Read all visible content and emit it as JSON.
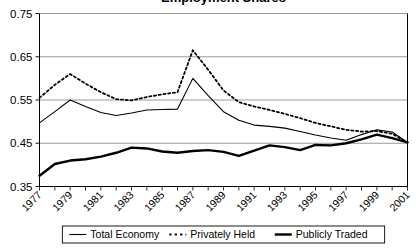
{
  "chart_data": {
    "type": "line",
    "title": "Employment Shares",
    "xlabel": "",
    "ylabel": "",
    "xlim": [
      1977,
      2001
    ],
    "ylim": [
      0.35,
      0.75
    ],
    "yticks": [
      0.35,
      0.45,
      0.55,
      0.65,
      0.75
    ],
    "ytick_labels": [
      "0.35",
      "0.45",
      "0.55",
      "0.65",
      "0.75"
    ],
    "x": [
      1977,
      1978,
      1979,
      1980,
      1981,
      1982,
      1983,
      1984,
      1985,
      1986,
      1987,
      1988,
      1989,
      1990,
      1991,
      1992,
      1993,
      1994,
      1995,
      1996,
      1997,
      1998,
      1999,
      2000,
      2001
    ],
    "xtick_labels": [
      "1977",
      "1979",
      "1981",
      "1983",
      "1985",
      "1987",
      "1989",
      "1991",
      "1993",
      "1995",
      "1997",
      "1999",
      "2001"
    ],
    "xtick_values": [
      1977,
      1979,
      1981,
      1983,
      1985,
      1987,
      1989,
      1991,
      1993,
      1995,
      1997,
      1999,
      2001
    ],
    "grid": true,
    "legend_position": "bottom",
    "series": [
      {
        "name": "Total Economy",
        "style": "solid-thin",
        "color": "#000000",
        "width": 1.1,
        "values": [
          0.497,
          0.523,
          0.55,
          0.535,
          0.521,
          0.514,
          0.52,
          0.527,
          0.528,
          0.529,
          0.6,
          0.56,
          0.523,
          0.503,
          0.492,
          0.489,
          0.485,
          0.477,
          0.469,
          0.462,
          0.457,
          0.47,
          0.481,
          0.476,
          0.452
        ]
      },
      {
        "name": "Privately Held",
        "style": "dotted",
        "color": "#000000",
        "width": 1.8,
        "values": [
          0.555,
          0.585,
          0.61,
          0.588,
          0.568,
          0.552,
          0.549,
          0.557,
          0.563,
          0.568,
          0.665,
          0.62,
          0.572,
          0.545,
          0.535,
          0.527,
          0.518,
          0.508,
          0.497,
          0.489,
          0.481,
          0.477,
          0.478,
          0.472,
          0.452
        ]
      },
      {
        "name": "Publicly Traded",
        "style": "solid-thick",
        "color": "#000000",
        "width": 2.4,
        "values": [
          0.375,
          0.402,
          0.41,
          0.413,
          0.419,
          0.428,
          0.44,
          0.438,
          0.431,
          0.428,
          0.432,
          0.434,
          0.43,
          0.421,
          0.433,
          0.445,
          0.441,
          0.434,
          0.446,
          0.445,
          0.45,
          0.459,
          0.47,
          0.462,
          0.452
        ]
      }
    ]
  },
  "legend": {
    "items": [
      {
        "label": "Total Economy",
        "marker": "solid-thin"
      },
      {
        "label": "Privately Held",
        "marker": "dotted"
      },
      {
        "label": "Publicly Traded",
        "marker": "solid-thick"
      }
    ]
  }
}
